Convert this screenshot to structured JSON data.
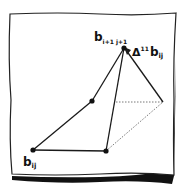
{
  "diagram": {
    "labels": {
      "bottom_left": "b",
      "bottom_left_sub": "ij",
      "apex": "b",
      "apex_sub": "i+1 j+1",
      "delta": "Δ",
      "delta_sup": "11",
      "delta_b": "b",
      "delta_b_sub": "ij"
    },
    "points": [
      {
        "name": "b_ij",
        "x": 33,
        "y": 150
      },
      {
        "name": "b_i+1_j",
        "x": 106,
        "y": 151
      },
      {
        "name": "b_i_j+1",
        "x": 92,
        "y": 101
      },
      {
        "name": "b_i+1_j+1",
        "x": 124,
        "y": 48
      }
    ],
    "virtual_point": {
      "x": 163,
      "y": 102
    },
    "colors": {
      "line": "#1a1a1a",
      "paper": "#ffffff",
      "shadow": "#111111"
    }
  }
}
